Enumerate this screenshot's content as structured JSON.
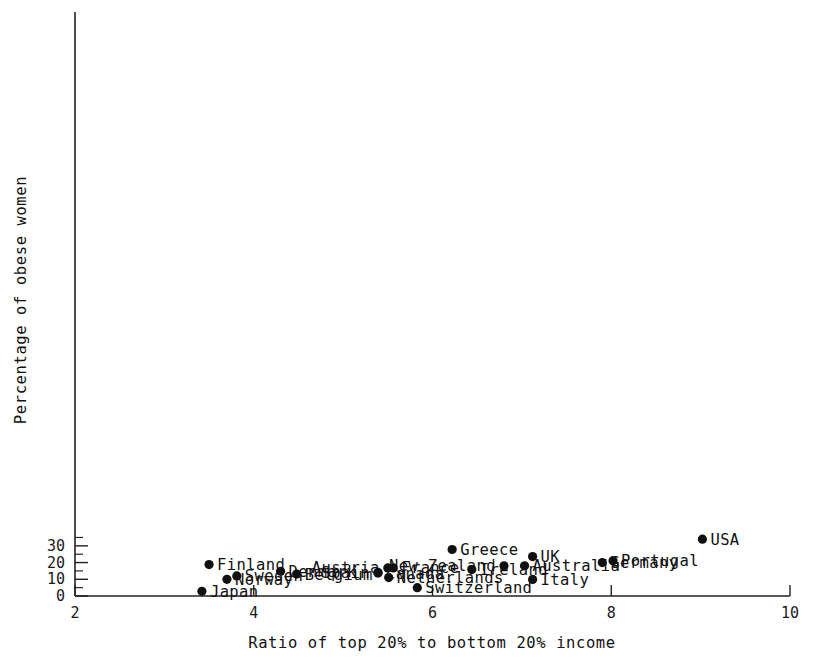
{
  "chart_data": {
    "type": "scatter",
    "title": "",
    "xlabel": "Ratio of top 20% to bottom 20% income",
    "ylabel": "Percentage of obese women",
    "xlim": [
      2,
      10
    ],
    "ylim": [
      0,
      35.5
    ],
    "xticks": [
      "2",
      "4",
      "6",
      "8",
      "10"
    ],
    "xtick_values": [
      2,
      4,
      6,
      8,
      10
    ],
    "yticks": [
      "0",
      "10",
      "20",
      "30"
    ],
    "ytick_values": [
      0,
      10,
      20,
      30
    ],
    "yminor_values": [
      5,
      15,
      25,
      35
    ],
    "grid": false,
    "legend": "none",
    "marker": "filled-circle",
    "marker_color": "#101010",
    "points": [
      {
        "label": "USA",
        "x": 9.02,
        "y": 34.0,
        "label_side": "right"
      },
      {
        "label": "Greece",
        "x": 6.22,
        "y": 27.8,
        "label_side": "right"
      },
      {
        "label": "UK",
        "x": 7.12,
        "y": 23.6,
        "label_side": "right"
      },
      {
        "label": "Portugal",
        "x": 8.02,
        "y": 21.1,
        "label_side": "right"
      },
      {
        "label": "Germany",
        "x": 7.9,
        "y": 20.0,
        "label_side": "right"
      },
      {
        "label": "Finland",
        "x": 3.5,
        "y": 18.8,
        "label_side": "right"
      },
      {
        "label": "New Zealand",
        "x": 6.8,
        "y": 18.1,
        "label_side": "left"
      },
      {
        "label": "Australia",
        "x": 7.03,
        "y": 18.1,
        "label_side": "right"
      },
      {
        "label": "Austria",
        "x": 5.5,
        "y": 16.8,
        "label_side": "left"
      },
      {
        "label": "France",
        "x": 5.56,
        "y": 16.8,
        "label_side": "right"
      },
      {
        "label": "Ireland",
        "x": 6.44,
        "y": 15.8,
        "label_side": "right"
      },
      {
        "label": "Denmark",
        "x": 4.3,
        "y": 14.8,
        "label_side": "right"
      },
      {
        "label": "Spain",
        "x": 5.39,
        "y": 14.1,
        "label_side": "left"
      },
      {
        "label": "Canada",
        "x": 5.39,
        "y": 13.7,
        "label_side": "right"
      },
      {
        "label": "Belgium",
        "x": 4.48,
        "y": 13.1,
        "label_side": "right"
      },
      {
        "label": "Sweden",
        "x": 3.81,
        "y": 12.0,
        "label_side": "right"
      },
      {
        "label": "Netherlands",
        "x": 5.51,
        "y": 11.0,
        "label_side": "right"
      },
      {
        "label": "Norway",
        "x": 3.7,
        "y": 10.0,
        "label_side": "right"
      },
      {
        "label": "Italy",
        "x": 7.12,
        "y": 9.9,
        "label_side": "right"
      },
      {
        "label": "Switzerland",
        "x": 5.83,
        "y": 5.0,
        "label_side": "right"
      },
      {
        "label": "Japan",
        "x": 3.42,
        "y": 2.8,
        "label_side": "right"
      }
    ]
  }
}
